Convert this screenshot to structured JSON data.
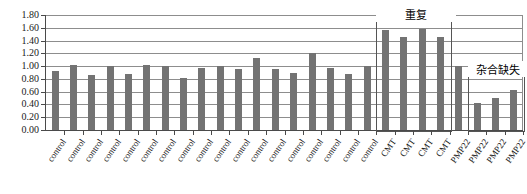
{
  "chart_data": {
    "type": "bar",
    "title": "",
    "xlabel": "",
    "ylabel": "",
    "ylim": [
      0.0,
      1.8
    ],
    "y_ticks": [
      "0.00",
      "0.20",
      "0.40",
      "0.60",
      "0.80",
      "1.00",
      "1.20",
      "1.40",
      "1.60",
      "1.80"
    ],
    "y_tick_values": [
      0.0,
      0.2,
      0.4,
      0.6,
      0.8,
      1.0,
      1.2,
      1.4,
      1.6,
      1.8
    ],
    "grid": true,
    "legend": "none",
    "bar_color": "#737373",
    "categories": [
      "control",
      "control",
      "control",
      "control",
      "control",
      "control",
      "control",
      "control",
      "control",
      "control",
      "control",
      "control",
      "control",
      "control",
      "control",
      "control",
      "control",
      "control",
      "CMT",
      "CMT",
      "CMT",
      "CMT",
      "PMP22",
      "PMP22",
      "PMP22",
      "PMP22"
    ],
    "values": [
      0.92,
      1.02,
      0.86,
      1.0,
      0.88,
      1.02,
      1.0,
      0.82,
      0.97,
      1.0,
      0.95,
      1.13,
      0.95,
      0.9,
      1.2,
      0.97,
      0.88,
      1.0,
      1.57,
      1.45,
      1.58,
      1.46,
      1.0,
      0.42,
      0.5,
      0.62
    ],
    "annotations": [
      {
        "label": "重复",
        "meaning": "duplication",
        "covers_categories": [
          "CMT",
          "CMT",
          "CMT",
          "CMT"
        ],
        "start_index": 18,
        "end_index": 21,
        "box_top_value": 1.72,
        "box_bottom_value": 0.0
      },
      {
        "label": "杂合缺失",
        "meaning": "heterozygous deletion",
        "covers_categories": [
          "PMP22",
          "PMP22",
          "PMP22"
        ],
        "start_index": 23,
        "end_index": 25,
        "box_top_value": 0.86,
        "box_bottom_value": 0.0
      }
    ]
  },
  "axis": {
    "y_labels": [
      "1.80",
      "1.60",
      "1.40",
      "1.20",
      "1.00",
      "0.80",
      "0.60",
      "0.40",
      "0.20",
      "0.00"
    ]
  },
  "groups": {
    "duplication_label": "重复",
    "deletion_label": "杂合缺失"
  }
}
